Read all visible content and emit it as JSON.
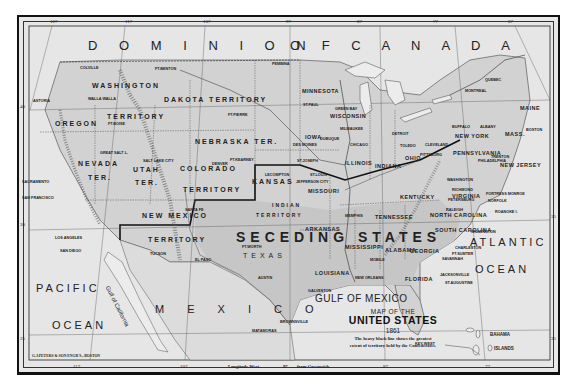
{
  "map": {
    "title": {
      "line1": "MAP OF THE",
      "line2": "UNITED STATES",
      "line3": "1861",
      "note_line1": "The heavy black line shows the greatest",
      "note_line2": "extent of territory held by the Confederates."
    },
    "publisher": "G.J.PETERS & SON ENGR'S., BOSTON",
    "longitude_caption": {
      "prefix": "Longitude West",
      "value": "97",
      "suffix": "from Greenwich"
    },
    "top_ticks": [
      "127",
      "117",
      "107",
      "97",
      "87",
      "77",
      "67"
    ],
    "bottom_ticks": [
      "117",
      "107",
      "87",
      "77"
    ],
    "left_ticks": [
      "40",
      "30",
      "25"
    ],
    "right_ticks": [
      "35",
      "25"
    ],
    "region_labels": {
      "dominion": "D O M I N I O N",
      "of_canada": "O F   C A N A D A",
      "pacific": "PACIFIC",
      "ocean_w": "OCEAN",
      "atlantic": "ATLANTIC",
      "ocean_e": "OCEAN",
      "gulf": "GULF OF MEXICO",
      "mexico": "M E X I C O",
      "gulf_california": "Gulf of California",
      "seceding": "SECEDING STATES"
    },
    "territories": [
      {
        "name": "WASHINGTON"
      },
      {
        "name": "TERRITORY"
      },
      {
        "name": "DAKOTA TERRITORY"
      },
      {
        "name": "OREGON"
      },
      {
        "name": "NEBRASKA TER."
      },
      {
        "name": "NEVADA"
      },
      {
        "name": "TER."
      },
      {
        "name": "UTAH"
      },
      {
        "name": "TER."
      },
      {
        "name": "COLORADO"
      },
      {
        "name": "TERRITORY"
      },
      {
        "name": "KANSAS"
      },
      {
        "name": "NEW MEXICO"
      },
      {
        "name": "TERRITORY"
      },
      {
        "name": "INDIAN"
      },
      {
        "name": "TERRITORY"
      },
      {
        "name": "TEXAS"
      }
    ],
    "states": [
      "MINNESOTA",
      "WISCONSIN",
      "IOWA",
      "ILLINOIS",
      "MISSOURI",
      "INDIANA",
      "OHIO",
      "MICHIGAN",
      "NEW YORK",
      "PENNSYLVANIA",
      "NEW JERSEY",
      "MAINE",
      "MASS.",
      "VT.",
      "N.H.",
      "KENTUCKY",
      "VIRGINIA",
      "TENNESSEE",
      "NORTH CAROLINA",
      "SOUTH CAROLINA",
      "GEORGIA",
      "ALABAMA",
      "MISSISSIPPI",
      "LOUISIANA",
      "ARKANSAS",
      "FLORIDA",
      "CALIFORNIA",
      "DELAWARE",
      "MARYLAND"
    ],
    "cities": [
      "FT.BENTON",
      "PEMBINA",
      "COLVILLE",
      "WALLA WALLA",
      "ASTORIA",
      "SALEM",
      "FT.BOISE",
      "FT.PIERRE",
      "ST.PAUL",
      "GREEN BAY",
      "MILWAUKEE",
      "CHICAGO",
      "DETROIT",
      "TOLEDO",
      "CLEVELAND",
      "BUFFALO",
      "ALBANY",
      "BOSTON",
      "QUEBEC",
      "MONTREAL",
      "PITTSBURG",
      "PHILADELPHIA",
      "TRENTON",
      "NEW YORK",
      "WASHINGTON",
      "BALTIMORE",
      "RICHMOND",
      "PETERSBURG",
      "FORTRESS MONROE",
      "NORFOLK",
      "ROANOKE I.",
      "RALEIGH",
      "WILMINGTON",
      "CHARLESTON",
      "FT.SUMTER",
      "SAVANNAH",
      "COLUMBIA",
      "AUGUSTA",
      "ATLANTA",
      "JACKSONVILLE",
      "ST.AUGUSTINE",
      "KEY WEST",
      "MONTGOMERY",
      "MOBILE",
      "NEW ORLEANS",
      "VICKSBURG",
      "JACKSON",
      "MEMPHIS",
      "NASHVILLE",
      "CHATTANOOGA",
      "LOUISVILLE",
      "CINCINNATI",
      "COLUMBUS",
      "INDIANAPOLIS",
      "ST.LOUIS",
      "JEFFERSON CITY",
      "ST.JOSEPH",
      "LECOMPTON",
      "DES MOINES",
      "DUBUQUE",
      "FT.KEARNEY",
      "DENVER",
      "SALT LAKE CITY",
      "GREAT SALT L.",
      "SANTA FE",
      "EL PASO",
      "TUCSON",
      "FT.WORTH",
      "AUSTIN",
      "GALVESTON",
      "BROWNSVILLE",
      "MATAMORAS",
      "SAN DIEGO",
      "LOS ANGELES",
      "SAN FRANCISCO",
      "SACRAMENTO",
      "SHREVEPORT",
      "LITTLE ROCK"
    ],
    "islands": {
      "bahama": "BAHAMA",
      "islands": "ISLANDS"
    },
    "colors": {
      "paper": "#e6e6e6",
      "land_shaded": "#cfcfcf",
      "water": "#ececec",
      "ink": "#222222",
      "border": "#111111"
    }
  }
}
